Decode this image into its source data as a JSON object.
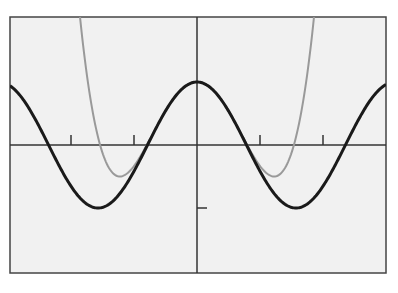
{
  "chart_data": {
    "type": "line",
    "title": "",
    "xlabel": "",
    "ylabel": "",
    "xlim": [
      -2.97,
      2.99
    ],
    "ylim": [
      -2.03,
      2.0
    ],
    "grid": false,
    "legend": null,
    "x_ticks": [
      -2,
      -1,
      1,
      2
    ],
    "y_ticks": [
      -1
    ],
    "tick_labels_visible": false,
    "series": [
      {
        "name": "cos(2x)",
        "color": "#1a1a1a",
        "style": "solid-thick",
        "formula": "cos(2x)",
        "key_points": [
          {
            "x": -1.5708,
            "y": -1
          },
          {
            "x": 0,
            "y": 1
          },
          {
            "x": 1.5708,
            "y": -1
          },
          {
            "x": -2.356,
            "y": 0
          },
          {
            "x": -0.785,
            "y": 0
          },
          {
            "x": 0.785,
            "y": 0
          },
          {
            "x": 2.356,
            "y": 0
          }
        ]
      },
      {
        "name": "Taylor polynomial 1 - 2x^2 + (2/3)x^4",
        "color": "#999999",
        "style": "solid-thin",
        "formula": "1 - 2x^2 + (2/3)x^4",
        "key_points": [
          {
            "x": -1.2247,
            "y": -0.5
          },
          {
            "x": 0,
            "y": 1
          },
          {
            "x": 1.2247,
            "y": -0.5
          }
        ]
      }
    ]
  },
  "colors": {
    "background": "#f1f1f1",
    "frame": "#444444",
    "axis": "#333333"
  }
}
